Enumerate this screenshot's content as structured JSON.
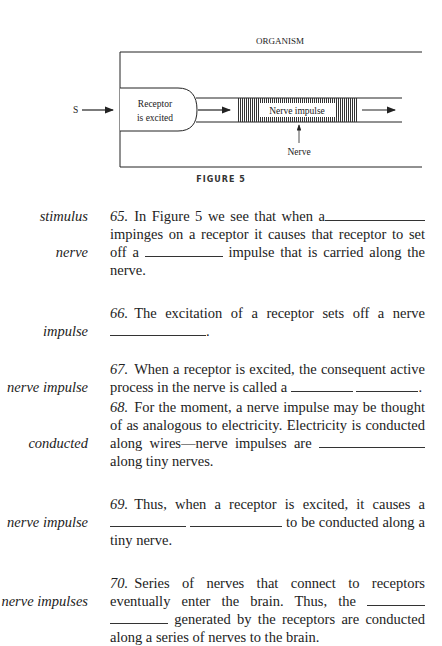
{
  "figure": {
    "title": "ORGANISM",
    "stimulus_label": "S",
    "receptor_label_line1": "Receptor",
    "receptor_label_line2": "is excited",
    "impulse_label": "Nerve impulse",
    "nerve_label": "Nerve",
    "caption": "FIGURE 5"
  },
  "frames": [
    {
      "number": "65.",
      "answers": [
        "stimulus",
        "nerve"
      ],
      "text": [
        "In Figure 5 we see that when a",
        "impinges on a receptor it causes that receptor to set off a",
        "impulse that is carried along the nerve."
      ]
    },
    {
      "number": "66.",
      "answers": [
        "impulse"
      ],
      "text": [
        "The excitation of a receptor sets off a nerve",
        "."
      ]
    },
    {
      "number": "67.",
      "answers": [
        "nerve impulse"
      ],
      "text": [
        "When a receptor is excited, the consequent active process in the nerve is called a",
        "."
      ]
    },
    {
      "number": "68.",
      "answers": [
        "conducted"
      ],
      "text": [
        "For the moment, a nerve impulse may be thought of as analogous to electricity. Electricity is conducted along wires—nerve impulses are",
        "along tiny nerves."
      ]
    },
    {
      "number": "69.",
      "answers": [
        "nerve impulse"
      ],
      "text": [
        "Thus, when a receptor is excited, it causes a",
        "to be conducted along a tiny nerve."
      ]
    },
    {
      "number": "70.",
      "answers": [
        "nerve impulses"
      ],
      "text": [
        "Series of nerves that connect to receptors eventually enter the brain. Thus, the",
        "generated by the receptors are conducted along a series of nerves to the brain."
      ]
    }
  ]
}
